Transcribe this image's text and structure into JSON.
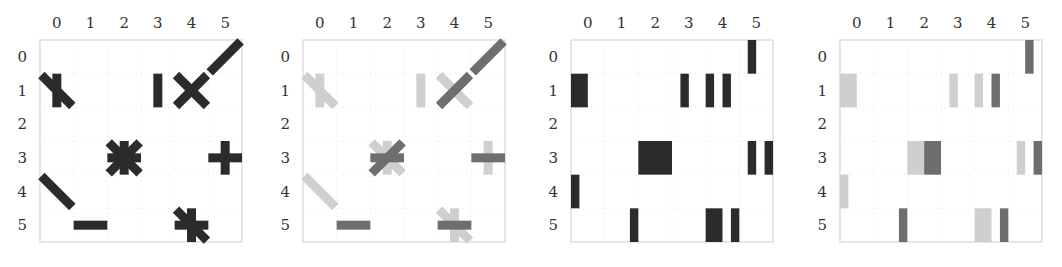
{
  "figure": {
    "grid_size": 6,
    "colors": {
      "dark": "#2b2b2b",
      "mid": "#6e6e6e",
      "light": "#cfcfcf",
      "grid": "#e4e4e4",
      "frame": "#d6d6d6"
    }
  },
  "chart_data": [
    {
      "type": "heatmap",
      "title": "",
      "subtitle": "Panel 1: glyph matrix (oriented strokes per cell)",
      "x_ticks": [
        "0",
        "1",
        "2",
        "3",
        "4",
        "5"
      ],
      "y_ticks": [
        "0",
        "1",
        "2",
        "3",
        "4",
        "5"
      ],
      "grid": true,
      "cells": [
        {
          "row": 0,
          "col": 5,
          "glyph": "/",
          "strokes": [
            {
              "angle": 45,
              "shade": "dark"
            }
          ]
        },
        {
          "row": 1,
          "col": 0,
          "glyph": "|\\",
          "strokes": [
            {
              "angle": 90,
              "shade": "dark"
            },
            {
              "angle": -45,
              "shade": "dark"
            }
          ]
        },
        {
          "row": 1,
          "col": 3,
          "glyph": "|",
          "strokes": [
            {
              "angle": 90,
              "shade": "dark"
            }
          ]
        },
        {
          "row": 1,
          "col": 4,
          "glyph": "X",
          "strokes": [
            {
              "angle": 45,
              "shade": "dark"
            },
            {
              "angle": -45,
              "shade": "dark"
            }
          ]
        },
        {
          "row": 3,
          "col": 2,
          "glyph": "*",
          "strokes": [
            {
              "angle": 0,
              "shade": "dark"
            },
            {
              "angle": 90,
              "shade": "dark"
            },
            {
              "angle": 45,
              "shade": "dark"
            },
            {
              "angle": -45,
              "shade": "dark"
            }
          ]
        },
        {
          "row": 3,
          "col": 5,
          "glyph": "+",
          "strokes": [
            {
              "angle": 0,
              "shade": "dark"
            },
            {
              "angle": 90,
              "shade": "dark"
            }
          ]
        },
        {
          "row": 4,
          "col": 0,
          "glyph": "\\",
          "strokes": [
            {
              "angle": -45,
              "shade": "dark"
            }
          ]
        },
        {
          "row": 5,
          "col": 1,
          "glyph": "-",
          "strokes": [
            {
              "angle": 0,
              "shade": "dark"
            }
          ]
        },
        {
          "row": 5,
          "col": 4,
          "glyph": "+\\",
          "strokes": [
            {
              "angle": 0,
              "shade": "dark"
            },
            {
              "angle": 90,
              "shade": "dark"
            },
            {
              "angle": -45,
              "shade": "dark"
            }
          ]
        }
      ]
    },
    {
      "type": "heatmap",
      "title": "",
      "subtitle": "Panel 2: same glyph matrix with strokes shaded by grade",
      "x_ticks": [
        "0",
        "1",
        "2",
        "3",
        "4",
        "5"
      ],
      "y_ticks": [
        "0",
        "1",
        "2",
        "3",
        "4",
        "5"
      ],
      "grid": true,
      "cells": [
        {
          "row": 0,
          "col": 5,
          "strokes": [
            {
              "angle": 45,
              "shade": "mid"
            }
          ]
        },
        {
          "row": 1,
          "col": 0,
          "strokes": [
            {
              "angle": 90,
              "shade": "light"
            },
            {
              "angle": -45,
              "shade": "light"
            }
          ]
        },
        {
          "row": 1,
          "col": 3,
          "strokes": [
            {
              "angle": 90,
              "shade": "light"
            }
          ]
        },
        {
          "row": 1,
          "col": 4,
          "strokes": [
            {
              "angle": -45,
              "shade": "light"
            },
            {
              "angle": 45,
              "shade": "mid"
            }
          ]
        },
        {
          "row": 3,
          "col": 2,
          "strokes": [
            {
              "angle": 90,
              "shade": "light"
            },
            {
              "angle": -45,
              "shade": "light"
            },
            {
              "angle": 0,
              "shade": "mid"
            },
            {
              "angle": 45,
              "shade": "mid"
            }
          ]
        },
        {
          "row": 3,
          "col": 5,
          "strokes": [
            {
              "angle": 90,
              "shade": "light"
            },
            {
              "angle": 0,
              "shade": "mid"
            }
          ]
        },
        {
          "row": 4,
          "col": 0,
          "strokes": [
            {
              "angle": -45,
              "shade": "light"
            }
          ]
        },
        {
          "row": 5,
          "col": 1,
          "strokes": [
            {
              "angle": 0,
              "shade": "mid"
            }
          ]
        },
        {
          "row": 5,
          "col": 4,
          "strokes": [
            {
              "angle": 90,
              "shade": "light"
            },
            {
              "angle": -45,
              "shade": "light"
            },
            {
              "angle": 0,
              "shade": "mid"
            }
          ]
        }
      ]
    },
    {
      "type": "heatmap",
      "title": "",
      "subtitle": "Panel 3: bar encoding (column offset, width in cell units)",
      "x_ticks": [
        "0",
        "1",
        "2",
        "3",
        "4",
        "5"
      ],
      "y_ticks": [
        "0",
        "1",
        "2",
        "3",
        "4",
        "5"
      ],
      "grid": true,
      "bars": [
        {
          "row": 0,
          "x": 5.25,
          "w": 0.25,
          "shade": "dark"
        },
        {
          "row": 1,
          "x": 0.0,
          "w": 0.5,
          "shade": "dark"
        },
        {
          "row": 1,
          "x": 3.25,
          "w": 0.25,
          "shade": "dark"
        },
        {
          "row": 1,
          "x": 4.0,
          "w": 0.25,
          "shade": "dark"
        },
        {
          "row": 1,
          "x": 4.5,
          "w": 0.25,
          "shade": "dark"
        },
        {
          "row": 3,
          "x": 2.0,
          "w": 1.0,
          "shade": "dark"
        },
        {
          "row": 3,
          "x": 5.25,
          "w": 0.25,
          "shade": "dark"
        },
        {
          "row": 3,
          "x": 5.75,
          "w": 0.25,
          "shade": "dark"
        },
        {
          "row": 4,
          "x": 0.0,
          "w": 0.25,
          "shade": "dark"
        },
        {
          "row": 5,
          "x": 1.75,
          "w": 0.25,
          "shade": "dark"
        },
        {
          "row": 5,
          "x": 4.0,
          "w": 0.5,
          "shade": "dark"
        },
        {
          "row": 5,
          "x": 4.75,
          "w": 0.25,
          "shade": "dark"
        }
      ]
    },
    {
      "type": "heatmap",
      "title": "",
      "subtitle": "Panel 4: bar encoding shaded by grade",
      "x_ticks": [
        "0",
        "1",
        "2",
        "3",
        "4",
        "5"
      ],
      "y_ticks": [
        "0",
        "1",
        "2",
        "3",
        "4",
        "5"
      ],
      "grid": true,
      "bars": [
        {
          "row": 0,
          "x": 5.5,
          "w": 0.25,
          "shade": "mid"
        },
        {
          "row": 1,
          "x": 0.0,
          "w": 0.5,
          "shade": "light"
        },
        {
          "row": 1,
          "x": 3.25,
          "w": 0.25,
          "shade": "light"
        },
        {
          "row": 1,
          "x": 4.0,
          "w": 0.25,
          "shade": "light"
        },
        {
          "row": 1,
          "x": 4.5,
          "w": 0.25,
          "shade": "mid"
        },
        {
          "row": 3,
          "x": 2.0,
          "w": 0.5,
          "shade": "light"
        },
        {
          "row": 3,
          "x": 2.5,
          "w": 0.5,
          "shade": "mid"
        },
        {
          "row": 3,
          "x": 5.25,
          "w": 0.25,
          "shade": "light"
        },
        {
          "row": 3,
          "x": 5.75,
          "w": 0.25,
          "shade": "mid"
        },
        {
          "row": 4,
          "x": 0.0,
          "w": 0.25,
          "shade": "light"
        },
        {
          "row": 5,
          "x": 1.75,
          "w": 0.25,
          "shade": "mid"
        },
        {
          "row": 5,
          "x": 4.0,
          "w": 0.5,
          "shade": "light"
        },
        {
          "row": 5,
          "x": 4.75,
          "w": 0.25,
          "shade": "mid"
        }
      ]
    }
  ],
  "layout": {
    "panels": [
      {
        "left": 40,
        "top": 40,
        "size": 202
      },
      {
        "left": 303,
        "top": 40,
        "size": 202
      },
      {
        "left": 571,
        "top": 40,
        "size": 202
      },
      {
        "left": 840,
        "top": 40,
        "size": 202
      }
    ]
  }
}
